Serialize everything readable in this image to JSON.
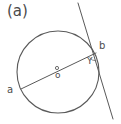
{
  "figure": {
    "panel_label": "(a)",
    "background_color": "#ffffff",
    "stroke_color": "#595959",
    "text_color": "#4d4d4d",
    "width": 121,
    "height": 124
  },
  "labels": {
    "point_a": "a",
    "point_b": "b",
    "center_o": "o",
    "angle_y": "Y"
  },
  "geometry": {
    "circle": {
      "center_x": 58,
      "center_y": 72,
      "radius": 41
    },
    "chord_ab": {
      "x1": 21,
      "y1": 89,
      "x2": 96,
      "y2": 53
    },
    "tangent_line": {
      "x1": 78,
      "y1": 3,
      "x2": 113,
      "y2": 119
    },
    "tangent_point": {
      "x": 95,
      "y": 53
    },
    "center_marker": {
      "x": 57,
      "y": 68,
      "r": 1.6
    },
    "angle_arc": {
      "path": "M 89.5 57.5 A 8 8 0 0 0 96.3 60.8"
    }
  }
}
